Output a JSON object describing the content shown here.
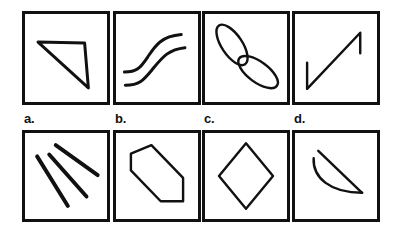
{
  "figure": {
    "background_color": "#ffffff",
    "ink_color": "#111111",
    "rows": 2,
    "columns": 4
  },
  "labels": {
    "a": "a.",
    "b": "b.",
    "c": "c.",
    "d": "d."
  },
  "panels": {
    "top": [
      {
        "id": "top-1",
        "shape_name": "right-triangle",
        "description": "Right triangle with horizontal top edge and vertical right edge, hypotenuse from top-left to bottom-right"
      },
      {
        "id": "top-2",
        "shape_name": "double-s-curve",
        "description": "Two parallel S-shaped (sigmoid) curves rising from lower-left to upper-right"
      },
      {
        "id": "top-3",
        "shape_name": "double-ellipse-propeller",
        "description": "Two elongated ellipses joined at the center forming a propeller or bowtie, tilted diagonally"
      },
      {
        "id": "top-4",
        "shape_name": "z-diagonal-with-stubs",
        "description": "Long diagonal line from lower-left to upper-right with a short vertical stub at each end"
      }
    ],
    "bottom": [
      {
        "id": "bottom-a",
        "label_key": "a",
        "shape_name": "three-diagonal-lines",
        "description": "Three straight line segments fanning out diagonally from upper-left to lower-right"
      },
      {
        "id": "bottom-b",
        "label_key": "b",
        "shape_name": "elongated-hexagon",
        "description": "Elongated hexagon tilted from upper-left to lower-right"
      },
      {
        "id": "bottom-c",
        "label_key": "c",
        "shape_name": "diamond-rhombus",
        "description": "Upright diamond or rhombus centered in the panel"
      },
      {
        "id": "bottom-d",
        "label_key": "d",
        "shape_name": "crescent-lens",
        "description": "Crescent sliver made of a straight diagonal chord and a curved arc bulging below it"
      }
    ]
  }
}
